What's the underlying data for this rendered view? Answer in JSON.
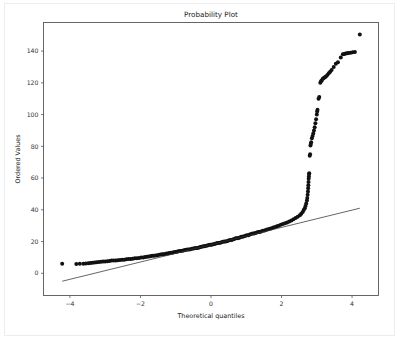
{
  "chart_data": {
    "type": "scatter",
    "title": "Probability Plot",
    "xlabel": "Theoretical quantiles",
    "ylabel": "Ordered Values",
    "xlim": [
      -4.75,
      4.75
    ],
    "ylim": [
      -14,
      158
    ],
    "xticks": [
      -4,
      -2,
      0,
      2,
      4
    ],
    "xticklabels": [
      "−4",
      "−2",
      "0",
      "2",
      "4"
    ],
    "yticks": [
      0,
      20,
      40,
      60,
      80,
      100,
      120,
      140
    ],
    "yticklabels": [
      "0",
      "20",
      "40",
      "60",
      "80",
      "100",
      "120",
      "140"
    ],
    "grid": false,
    "legend": null,
    "marker_color": "#111111",
    "line_color": "#333333",
    "series": [
      {
        "name": "Ordered Values",
        "marker": "filled-circle",
        "marker_size": 2.0,
        "points": [
          [
            -4.22,
            6.0
          ],
          [
            -3.82,
            5.8
          ],
          [
            -3.72,
            6.0
          ],
          [
            -3.62,
            6.0
          ],
          [
            -3.55,
            6.2
          ],
          [
            -3.48,
            6.3
          ],
          [
            -3.42,
            6.4
          ],
          [
            -3.36,
            6.6
          ],
          [
            -3.3,
            6.8
          ],
          [
            -3.24,
            7.0
          ],
          [
            -3.18,
            7.1
          ],
          [
            -3.12,
            7.2
          ],
          [
            -3.06,
            7.4
          ],
          [
            -3.0,
            7.5
          ],
          [
            -2.94,
            7.6
          ],
          [
            -2.88,
            7.8
          ],
          [
            -2.82,
            8.0
          ],
          [
            -2.76,
            8.0
          ],
          [
            -2.7,
            8.1
          ],
          [
            -2.64,
            8.2
          ],
          [
            -2.58,
            8.4
          ],
          [
            -2.52,
            8.5
          ],
          [
            -2.46,
            8.6
          ],
          [
            -2.4,
            8.8
          ],
          [
            -2.34,
            9.0
          ],
          [
            -2.28,
            9.0
          ],
          [
            -2.22,
            9.2
          ],
          [
            -2.16,
            9.4
          ],
          [
            -2.1,
            9.5
          ],
          [
            -2.04,
            9.7
          ],
          [
            -1.98,
            10.0
          ],
          [
            -1.92,
            10.0
          ],
          [
            -1.87,
            10.2
          ],
          [
            -1.82,
            10.4
          ],
          [
            -1.77,
            10.6
          ],
          [
            -1.72,
            10.8
          ],
          [
            -1.67,
            11.0
          ],
          [
            -1.62,
            11.0
          ],
          [
            -1.57,
            11.2
          ],
          [
            -1.52,
            11.4
          ],
          [
            -1.47,
            11.6
          ],
          [
            -1.42,
            11.8
          ],
          [
            -1.38,
            12.0
          ],
          [
            -1.34,
            12.0
          ],
          [
            -1.3,
            12.2
          ],
          [
            -1.26,
            12.4
          ],
          [
            -1.22,
            12.5
          ],
          [
            -1.18,
            12.7
          ],
          [
            -1.14,
            13.0
          ],
          [
            -1.1,
            13.0
          ],
          [
            -1.06,
            13.2
          ],
          [
            -1.02,
            13.4
          ],
          [
            -0.98,
            13.5
          ],
          [
            -0.94,
            13.7
          ],
          [
            -0.9,
            14.0
          ],
          [
            -0.86,
            14.0
          ],
          [
            -0.82,
            14.2
          ],
          [
            -0.78,
            14.4
          ],
          [
            -0.74,
            14.6
          ],
          [
            -0.7,
            14.8
          ],
          [
            -0.66,
            15.0
          ],
          [
            -0.62,
            15.0
          ],
          [
            -0.58,
            15.2
          ],
          [
            -0.54,
            15.4
          ],
          [
            -0.5,
            15.6
          ],
          [
            -0.46,
            15.8
          ],
          [
            -0.42,
            16.0
          ],
          [
            -0.38,
            16.0
          ],
          [
            -0.34,
            16.2
          ],
          [
            -0.3,
            16.5
          ],
          [
            -0.26,
            16.7
          ],
          [
            -0.22,
            17.0
          ],
          [
            -0.18,
            17.0
          ],
          [
            -0.14,
            17.3
          ],
          [
            -0.1,
            17.5
          ],
          [
            -0.06,
            17.8
          ],
          [
            -0.02,
            18.0
          ],
          [
            0.02,
            18.0
          ],
          [
            0.06,
            18.3
          ],
          [
            0.1,
            18.5
          ],
          [
            0.14,
            18.8
          ],
          [
            0.18,
            19.0
          ],
          [
            0.22,
            19.0
          ],
          [
            0.26,
            19.3
          ],
          [
            0.3,
            19.5
          ],
          [
            0.34,
            19.8
          ],
          [
            0.38,
            20.0
          ],
          [
            0.42,
            20.0
          ],
          [
            0.46,
            20.3
          ],
          [
            0.5,
            20.6
          ],
          [
            0.54,
            20.9
          ],
          [
            0.58,
            21.0
          ],
          [
            0.62,
            21.3
          ],
          [
            0.66,
            21.6
          ],
          [
            0.7,
            22.0
          ],
          [
            0.74,
            22.0
          ],
          [
            0.78,
            22.3
          ],
          [
            0.82,
            22.6
          ],
          [
            0.86,
            23.0
          ],
          [
            0.9,
            23.0
          ],
          [
            0.94,
            23.4
          ],
          [
            0.98,
            23.7
          ],
          [
            1.02,
            24.0
          ],
          [
            1.06,
            24.0
          ],
          [
            1.1,
            24.4
          ],
          [
            1.14,
            24.7
          ],
          [
            1.18,
            25.0
          ],
          [
            1.22,
            25.0
          ],
          [
            1.26,
            25.4
          ],
          [
            1.3,
            25.7
          ],
          [
            1.34,
            26.0
          ],
          [
            1.38,
            26.0
          ],
          [
            1.42,
            26.4
          ],
          [
            1.47,
            26.8
          ],
          [
            1.52,
            27.0
          ],
          [
            1.57,
            27.4
          ],
          [
            1.62,
            27.8
          ],
          [
            1.67,
            28.0
          ],
          [
            1.72,
            28.4
          ],
          [
            1.77,
            28.8
          ],
          [
            1.82,
            29.2
          ],
          [
            1.87,
            29.6
          ],
          [
            1.92,
            30.0
          ],
          [
            1.98,
            30.5
          ],
          [
            2.04,
            31.0
          ],
          [
            2.1,
            31.5
          ],
          [
            2.16,
            32.0
          ],
          [
            2.22,
            32.6
          ],
          [
            2.28,
            33.2
          ],
          [
            2.34,
            34.0
          ],
          [
            2.4,
            34.8
          ],
          [
            2.46,
            35.6
          ],
          [
            2.52,
            36.6
          ],
          [
            2.56,
            37.5
          ],
          [
            2.6,
            38.6
          ],
          [
            2.63,
            39.8
          ],
          [
            2.66,
            41.0
          ],
          [
            2.68,
            42.4
          ],
          [
            2.7,
            44.0
          ],
          [
            2.72,
            45.8
          ],
          [
            2.73,
            47.5
          ],
          [
            2.74,
            49.5
          ],
          [
            2.75,
            51.5
          ],
          [
            2.755,
            53.5
          ],
          [
            2.76,
            55.5
          ],
          [
            2.765,
            57.5
          ],
          [
            2.77,
            59.5
          ],
          [
            2.775,
            61.0
          ],
          [
            2.78,
            62.5
          ],
          [
            2.785,
            63.0
          ],
          [
            2.8,
            74.0
          ],
          [
            2.81,
            75.0
          ],
          [
            2.82,
            80.5
          ],
          [
            2.83,
            81.5
          ],
          [
            2.84,
            82.5
          ],
          [
            2.86,
            85.0
          ],
          [
            2.88,
            86.5
          ],
          [
            2.9,
            88.0
          ],
          [
            2.92,
            90.0
          ],
          [
            2.94,
            92.0
          ],
          [
            2.96,
            94.5
          ],
          [
            2.98,
            97.0
          ],
          [
            3.0,
            100.0
          ],
          [
            3.01,
            102.0
          ],
          [
            3.02,
            103.0
          ],
          [
            3.05,
            110.0
          ],
          [
            3.07,
            111.0
          ],
          [
            3.1,
            120.0
          ],
          [
            3.12,
            121.0
          ],
          [
            3.14,
            121.5
          ],
          [
            3.17,
            122.5
          ],
          [
            3.2,
            123.0
          ],
          [
            3.23,
            123.5
          ],
          [
            3.26,
            124.0
          ],
          [
            3.3,
            125.0
          ],
          [
            3.34,
            126.0
          ],
          [
            3.38,
            127.0
          ],
          [
            3.42,
            128.0
          ],
          [
            3.48,
            130.0
          ],
          [
            3.54,
            132.0
          ],
          [
            3.6,
            133.0
          ],
          [
            3.68,
            136.0
          ],
          [
            3.74,
            138.0
          ],
          [
            3.78,
            138.2
          ],
          [
            3.82,
            138.4
          ],
          [
            3.86,
            138.6
          ],
          [
            3.9,
            138.8
          ],
          [
            3.96,
            139.0
          ],
          [
            4.02,
            139.2
          ],
          [
            4.08,
            139.4
          ],
          [
            4.22,
            150.5
          ]
        ]
      }
    ],
    "fit_line": {
      "name": "reference-line",
      "x": [
        -4.22,
        4.22
      ],
      "y": [
        -5.0,
        41.0
      ]
    }
  }
}
